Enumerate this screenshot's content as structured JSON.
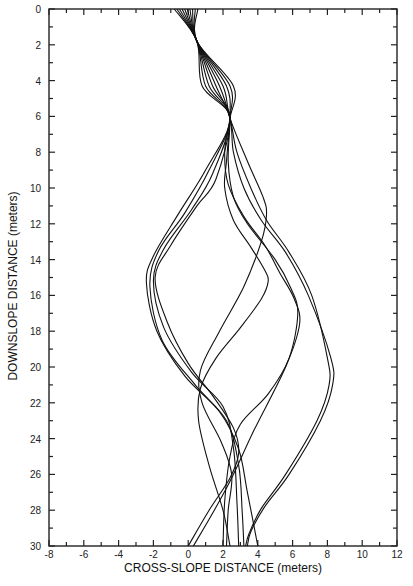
{
  "chart_data": {
    "type": "line",
    "title": "",
    "xlabel": "CROSS-SLOPE DISTANCE (meters)",
    "ylabel": "DOWNSLOPE DISTANCE (meters)",
    "xlim": [
      -8,
      12
    ],
    "ylim": [
      0,
      30
    ],
    "y_inverted": true,
    "grid": false,
    "legend": null,
    "x_ticks": [
      -8,
      -6,
      -4,
      -2,
      0,
      2,
      4,
      6,
      8,
      10,
      12
    ],
    "x_minor_step": 1,
    "y_ticks": [
      0,
      2,
      4,
      6,
      8,
      10,
      12,
      14,
      16,
      18,
      20,
      22,
      24,
      26,
      28,
      30
    ],
    "y_minor_step": 1,
    "series": [
      {
        "name": "trajectory 1",
        "points": [
          [
            -0.8,
            0
          ],
          [
            0.5,
            1.8
          ],
          [
            0.8,
            4.3
          ],
          [
            2.4,
            6.1
          ],
          [
            1.0,
            9.0
          ],
          [
            -0.6,
            11.5
          ],
          [
            -2.0,
            13.8
          ],
          [
            -2.4,
            15.3
          ],
          [
            -1.8,
            18.0
          ],
          [
            -0.2,
            20.5
          ],
          [
            1.8,
            22.5
          ],
          [
            2.9,
            24.6
          ],
          [
            3.4,
            27.0
          ],
          [
            4.0,
            30
          ]
        ]
      },
      {
        "name": "trajectory 2",
        "points": [
          [
            -0.65,
            0
          ],
          [
            0.5,
            1.8
          ],
          [
            1.0,
            4.3
          ],
          [
            2.4,
            6.1
          ],
          [
            1.2,
            9.0
          ],
          [
            -0.2,
            11.4
          ],
          [
            -1.7,
            13.5
          ],
          [
            -2.2,
            15.5
          ],
          [
            -1.5,
            18.5
          ],
          [
            0.4,
            21.0
          ],
          [
            2.2,
            23.0
          ],
          [
            2.9,
            25.5
          ],
          [
            3.1,
            28.0
          ],
          [
            3.2,
            30
          ]
        ]
      },
      {
        "name": "trajectory 3",
        "points": [
          [
            -0.5,
            0
          ],
          [
            0.5,
            1.8
          ],
          [
            1.2,
            4.3
          ],
          [
            2.4,
            6.1
          ],
          [
            1.4,
            9.2
          ],
          [
            0.2,
            11.2
          ],
          [
            -1.4,
            13.4
          ],
          [
            -2.0,
            15.2
          ],
          [
            -1.4,
            17.8
          ],
          [
            0.2,
            20.3
          ],
          [
            2.0,
            22.2
          ],
          [
            2.6,
            24.5
          ],
          [
            2.8,
            27.5
          ],
          [
            2.9,
            30
          ]
        ]
      },
      {
        "name": "trajectory 4",
        "points": [
          [
            -0.35,
            0
          ],
          [
            0.5,
            1.8
          ],
          [
            1.4,
            4.3
          ],
          [
            2.4,
            6.1
          ],
          [
            1.6,
            9.5
          ],
          [
            0.5,
            11.0
          ],
          [
            -1.0,
            13.2
          ],
          [
            -1.9,
            15.0
          ],
          [
            -1.2,
            17.5
          ],
          [
            0.0,
            19.8
          ],
          [
            1.4,
            21.6
          ],
          [
            2.6,
            23.4
          ],
          [
            2.9,
            24.8
          ],
          [
            2.4,
            26.2
          ],
          [
            1.2,
            28.0
          ],
          [
            0.0,
            30
          ]
        ]
      },
      {
        "name": "trajectory 5",
        "points": [
          [
            -0.2,
            0
          ],
          [
            0.5,
            1.8
          ],
          [
            1.6,
            4.3
          ],
          [
            2.4,
            6.1
          ],
          [
            2.6,
            8.0
          ],
          [
            3.2,
            10.0
          ],
          [
            4.2,
            11.8
          ],
          [
            5.6,
            13.6
          ],
          [
            6.9,
            16.0
          ],
          [
            8.2,
            19.5
          ],
          [
            8.3,
            21.0
          ],
          [
            7.6,
            23.0
          ],
          [
            5.8,
            26.0
          ],
          [
            4.4,
            27.8
          ],
          [
            3.6,
            29.2
          ],
          [
            3.4,
            30
          ]
        ]
      },
      {
        "name": "trajectory 6",
        "points": [
          [
            -0.05,
            0
          ],
          [
            0.5,
            1.8
          ],
          [
            1.8,
            4.3
          ],
          [
            2.4,
            6.1
          ],
          [
            2.8,
            8.0
          ],
          [
            3.6,
            10.0
          ],
          [
            4.5,
            11.8
          ],
          [
            5.8,
            13.6
          ],
          [
            7.1,
            16.0
          ],
          [
            8.0,
            19.5
          ],
          [
            8.1,
            21.0
          ],
          [
            7.4,
            23.0
          ],
          [
            5.6,
            26.0
          ],
          [
            4.2,
            27.9
          ],
          [
            3.5,
            29.3
          ],
          [
            3.3,
            30
          ]
        ]
      },
      {
        "name": "trajectory 7",
        "points": [
          [
            0.1,
            0
          ],
          [
            0.5,
            1.8
          ],
          [
            2.0,
            4.3
          ],
          [
            2.4,
            6.1
          ],
          [
            3.4,
            8.5
          ],
          [
            4.3,
            10.5
          ],
          [
            4.5,
            11.5
          ],
          [
            4.2,
            13.0
          ],
          [
            3.2,
            15.5
          ],
          [
            1.8,
            18.0
          ],
          [
            0.7,
            20.2
          ],
          [
            0.8,
            22.0
          ],
          [
            1.9,
            24.2
          ],
          [
            2.5,
            26.0
          ],
          [
            2.3,
            28.0
          ],
          [
            2.2,
            30
          ]
        ]
      },
      {
        "name": "trajectory 8",
        "points": [
          [
            0.25,
            0
          ],
          [
            0.5,
            1.8
          ],
          [
            2.2,
            4.3
          ],
          [
            2.4,
            6.1
          ],
          [
            2.3,
            8.5
          ],
          [
            2.6,
            10.5
          ],
          [
            3.4,
            12.0
          ],
          [
            5.0,
            14.0
          ],
          [
            5.9,
            15.6
          ],
          [
            6.3,
            17.0
          ],
          [
            5.8,
            19.5
          ],
          [
            4.6,
            21.5
          ],
          [
            3.0,
            23.2
          ],
          [
            2.4,
            25.0
          ],
          [
            2.1,
            27.5
          ],
          [
            2.0,
            30
          ]
        ]
      },
      {
        "name": "trajectory 9",
        "points": [
          [
            0.4,
            0
          ],
          [
            0.5,
            1.8
          ],
          [
            2.4,
            4.3
          ],
          [
            2.4,
            6.1
          ],
          [
            2.2,
            8.5
          ],
          [
            2.1,
            10.0
          ],
          [
            2.6,
            11.8
          ],
          [
            3.6,
            13.3
          ],
          [
            4.4,
            14.6
          ],
          [
            4.6,
            15.2
          ],
          [
            4.2,
            16.2
          ],
          [
            3.0,
            17.8
          ],
          [
            1.6,
            19.5
          ],
          [
            0.7,
            21.2
          ],
          [
            0.6,
            23.0
          ],
          [
            1.2,
            25.5
          ],
          [
            2.0,
            28.0
          ],
          [
            2.4,
            30
          ]
        ]
      },
      {
        "name": "trajectory 10",
        "points": [
          [
            0.55,
            0
          ],
          [
            0.5,
            1.8
          ],
          [
            2.6,
            4.3
          ],
          [
            2.4,
            6.1
          ],
          [
            2.1,
            8.0
          ],
          [
            2.3,
            9.8
          ],
          [
            3.2,
            11.6
          ],
          [
            4.4,
            13.2
          ],
          [
            5.3,
            14.8
          ],
          [
            6.1,
            16.2
          ],
          [
            6.4,
            17.6
          ],
          [
            5.6,
            20.0
          ],
          [
            3.8,
            23.5
          ],
          [
            2.6,
            26.0
          ],
          [
            1.5,
            28.0
          ],
          [
            0.3,
            30
          ]
        ]
      }
    ]
  },
  "axes": {
    "x_title": "CROSS-SLOPE DISTANCE (meters)",
    "y_title": "DOWNSLOPE DISTANCE (meters)",
    "x_tick_labels": [
      "-8",
      "-6",
      "-4",
      "-2",
      "0",
      "2",
      "4",
      "6",
      "8",
      "10",
      "12"
    ],
    "y_tick_labels": [
      "0",
      "2",
      "4",
      "6",
      "8",
      "10",
      "12",
      "14",
      "16",
      "18",
      "20",
      "22",
      "24",
      "26",
      "28",
      "30"
    ]
  },
  "colors": {
    "line": "#111111",
    "frame": "#222222",
    "background": "#ffffff"
  }
}
